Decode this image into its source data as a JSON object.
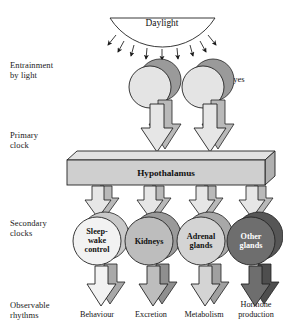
{
  "figure": {
    "background": "#ffffff"
  },
  "row_labels": [
    {
      "id": "entrainment",
      "line1": "Entrainment",
      "line2": "by light"
    },
    {
      "id": "primary-clock",
      "line1": "Primary",
      "line2": "clock"
    },
    {
      "id": "secondary-clocks",
      "line1": "Secondary",
      "line2": "clocks"
    },
    {
      "id": "observable-rhythms",
      "line1": "Observable",
      "line2": "rhythms"
    }
  ],
  "daylight": {
    "label": "Daylight",
    "ray_count": 9
  },
  "eyes": {
    "label": "Eyes",
    "count": 2,
    "fill": "#e4e4e4"
  },
  "hypothalamus": {
    "label": "Hypothalamus",
    "fill": "#cfcfcf",
    "top_fill": "#e2e2e2",
    "side_fill": "#b0b0b0"
  },
  "secondary_clocks": [
    {
      "id": "sleep-wake-control",
      "lines": [
        "Sleep-",
        "wake",
        "control"
      ],
      "fill": "#f2f2f2",
      "text_color": "#111111"
    },
    {
      "id": "kidneys",
      "lines": [
        "Kidneys"
      ],
      "fill": "#bdbdbd",
      "text_color": "#111111"
    },
    {
      "id": "adrenal-glands",
      "lines": [
        "Adrenal",
        "glands"
      ],
      "fill": "#d4d4d4",
      "text_color": "#111111"
    },
    {
      "id": "other-glands",
      "lines": [
        "Other",
        "glands"
      ],
      "fill": "#6e6e6e",
      "text_color": "#ffffff"
    }
  ],
  "outputs": [
    {
      "id": "behaviour",
      "lines": [
        "Behaviour"
      ],
      "fill": "#f2f2f2"
    },
    {
      "id": "excretion",
      "lines": [
        "Excretion"
      ],
      "fill": "#bdbdbd"
    },
    {
      "id": "metabolism",
      "lines": [
        "Metabolism"
      ],
      "fill": "#d4d4d4"
    },
    {
      "id": "hormone-production",
      "lines": [
        "Hormone",
        "production"
      ],
      "fill": "#6e6e6e"
    }
  ],
  "colors": {
    "stroke": "#222222",
    "arrow_light": "#e6e6e6",
    "arrow_shadow": "#b9b9b9",
    "shadow_circle": "#9a9a9a"
  }
}
